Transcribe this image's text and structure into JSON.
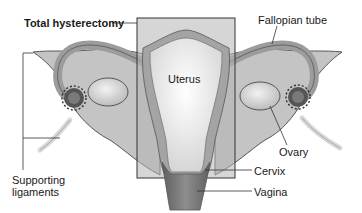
{
  "diagram": {
    "title": "Total hysterectomy",
    "labels": {
      "total_hysterectomy": "Total hysterectomy",
      "fallopian_tube": "Fallopian tube",
      "uterus": "Uterus",
      "ovary": "Ovary",
      "cervix": "Cervix",
      "vagina": "Vagina",
      "supporting_ligaments_line1": "Supporting",
      "supporting_ligaments_line2": "ligaments"
    },
    "colors": {
      "background": "#ffffff",
      "broad_ligament": "#c9c9c9",
      "tube": "#bdbdbd",
      "ovary": "#d8d8d8",
      "fimbriae": "#4a4a4a",
      "uterus": "#ececec",
      "uterine_wall": "#9a9a9a",
      "vagina": "#7d7d7d",
      "removal_box_fill": "#b0b0b0",
      "outline": "#333333"
    }
  }
}
